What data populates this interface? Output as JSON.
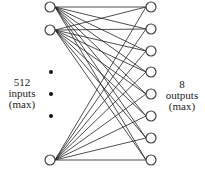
{
  "diagram": {
    "left_label": {
      "lines": [
        "512",
        "inputs",
        "(max)"
      ]
    },
    "right_label": {
      "lines": [
        "8",
        "outputs",
        "(max)"
      ]
    },
    "inputs": [
      {
        "id": "input-1",
        "cx": 50,
        "cy": 7
      },
      {
        "id": "input-2",
        "cx": 50,
        "cy": 30
      },
      {
        "id": "input-n",
        "cx": 50,
        "cy": 160
      }
    ],
    "ellipsis_dots": [
      {
        "cx": 51,
        "cy": 72
      },
      {
        "cx": 51,
        "cy": 94
      },
      {
        "cx": 51,
        "cy": 116
      }
    ],
    "outputs": [
      {
        "id": "output-1",
        "cx": 151,
        "cy": 7
      },
      {
        "id": "output-2",
        "cx": 151,
        "cy": 29
      },
      {
        "id": "output-3",
        "cx": 151,
        "cy": 51
      },
      {
        "id": "output-4",
        "cx": 151,
        "cy": 72
      },
      {
        "id": "output-5",
        "cx": 151,
        "cy": 94
      },
      {
        "id": "output-6",
        "cx": 151,
        "cy": 116
      },
      {
        "id": "output-7",
        "cx": 151,
        "cy": 138
      },
      {
        "id": "output-8",
        "cx": 151,
        "cy": 160
      }
    ],
    "node_radius": 5,
    "connectivity": "fully-connected",
    "colors": {
      "line": "#222222",
      "node_stroke": "#444444",
      "node_fill": "#ffffff",
      "dot": "#111111"
    }
  }
}
